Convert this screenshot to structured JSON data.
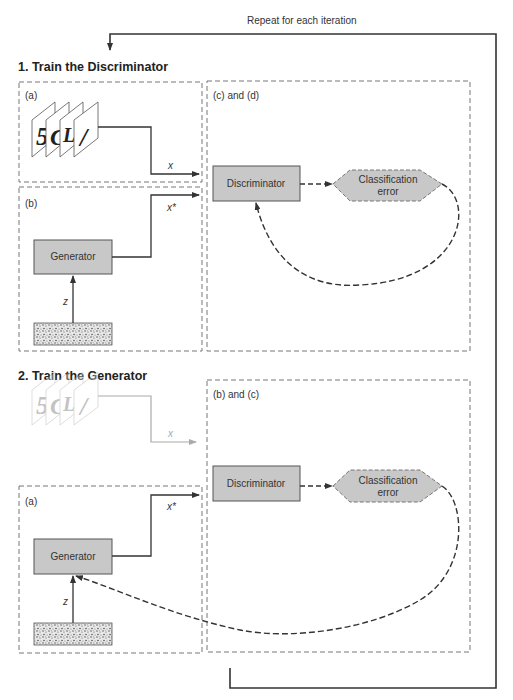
{
  "loop_label": "Repeat for each iteration",
  "section1": {
    "title": "1. Train the Discriminator",
    "panel_a": {
      "label": "(a)",
      "output_var": "x"
    },
    "panel_b": {
      "label": "(b)",
      "generator": "Generator",
      "noise_var": "z",
      "output_var": "x*"
    },
    "panel_cd": {
      "label": "(c) and (d)",
      "discriminator": "Discriminator",
      "error_line1": "Classification",
      "error_line2": "error"
    },
    "digits": [
      "5",
      "C",
      "L",
      "/"
    ]
  },
  "section2": {
    "title": "2. Train the Generator",
    "real_var": "x",
    "panel_a": {
      "label": "(a)",
      "generator": "Generator",
      "noise_var": "z",
      "output_var": "x*"
    },
    "panel_bc": {
      "label": "(b) and (c)",
      "discriminator": "Discriminator",
      "error_line1": "Classification",
      "error_line2": "error"
    },
    "digits": [
      "5",
      "C",
      "L",
      "/"
    ]
  },
  "colors": {
    "box_fill": "#c8c8c8",
    "box_stroke": "#555555",
    "line": "#333333",
    "dash_panel": "#777777",
    "ghost": "#aaaaaa"
  }
}
